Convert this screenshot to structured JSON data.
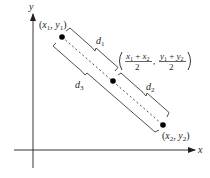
{
  "diagram": {
    "type": "midpoint-formula-illustration",
    "colors": {
      "ink": "#231f20",
      "background": "#ffffff"
    },
    "axes": {
      "x_label": "x",
      "y_label": "y",
      "origin": [
        33,
        150
      ],
      "x_end": [
        195,
        150
      ],
      "y_end": [
        33,
        14
      ]
    },
    "points": [
      {
        "id": "p1",
        "label": "(x1, y1)",
        "x": 62,
        "y": 37
      },
      {
        "id": "midpoint",
        "label": "((x1 + x2)/2, (y1 + y2)/2)",
        "x": 113,
        "y": 81
      },
      {
        "id": "p2",
        "label": "(x2, y2)",
        "x": 163,
        "y": 125
      }
    ],
    "distances": [
      {
        "id": "d1",
        "label": "d",
        "sub": "1",
        "from": "p1",
        "to": "midpoint",
        "side": "upper"
      },
      {
        "id": "d2",
        "label": "d",
        "sub": "2",
        "from": "midpoint",
        "to": "p2",
        "side": "upper"
      },
      {
        "id": "d3",
        "label": "d",
        "sub": "3",
        "from": "p1",
        "to": "p2",
        "side": "lower"
      }
    ],
    "midpoint_formula": {
      "x_numerator": "x1 + x2",
      "x_denominator": "2",
      "y_numerator": "y1 + y2",
      "y_denominator": "2"
    }
  }
}
